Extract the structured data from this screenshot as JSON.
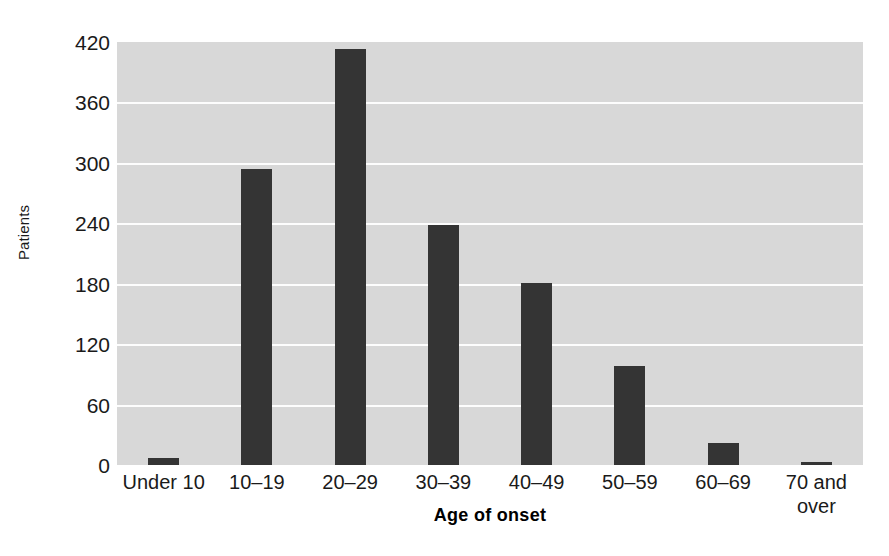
{
  "chart_data": {
    "type": "bar",
    "title": "",
    "subtitle": "",
    "xlabel": "Age of onset",
    "ylabel": "Patients",
    "categories": [
      "Under 10",
      "10–19",
      "20–29",
      "30–39",
      "40–49",
      "50–59",
      "60–69",
      "70 and over"
    ],
    "values": [
      7,
      294,
      413,
      238,
      181,
      98,
      22,
      3
    ],
    "ylim": [
      0,
      420
    ],
    "yticks": [
      0,
      60,
      120,
      180,
      240,
      300,
      360,
      420
    ],
    "ytick_labels": [
      "0",
      "60",
      "120",
      "180",
      "240",
      "300",
      "360",
      "420"
    ],
    "grid": true,
    "grid_axis": "y",
    "legend": null,
    "legend_position": "none",
    "colors": {
      "bar": "#343434",
      "plot_background": "#d8d8d8",
      "gridline": "#fdfdfd",
      "figure_background": "#ffffff",
      "text": "#1a1a1a"
    },
    "annotations": []
  },
  "axis": {
    "y_title": "Patients",
    "x_title": "Age of onset"
  }
}
